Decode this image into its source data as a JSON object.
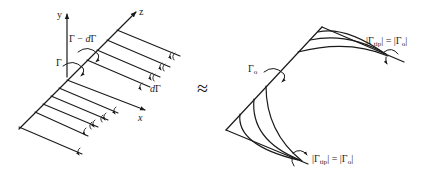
{
  "left_diagram": {
    "axes": {
      "y": "y",
      "z": "z",
      "x": "x"
    },
    "labels": {
      "gamma": "Γ",
      "gamma_minus": "Γ − ",
      "d_gamma_d": "d",
      "d_gamma_G": "Γ",
      "dgamma_d": "d",
      "dgamma_G": "Γ"
    }
  },
  "approx_symbol": "≈",
  "right_diagram": {
    "gamma_o_main": "Γ",
    "gamma_o_sub": "o",
    "tip_label_top": {
      "open": "|Γ",
      "sub": "tip",
      "rest": "| = |Γ",
      "sub2": "o",
      "close": "|"
    },
    "tip_label_bottom": {
      "open": "|Γ",
      "sub": "tip",
      "rest": "| = |Γ",
      "sub2": "o",
      "close": "|"
    }
  },
  "colors": {
    "stroke": "#1a1a1a",
    "background": "#ffffff"
  }
}
